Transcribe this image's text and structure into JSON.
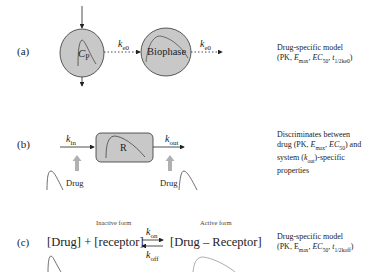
{
  "panels": {
    "a": {
      "tag": "(a)",
      "compartment_label": "C",
      "compartment_sub": "P",
      "rate1": "k",
      "rate1_sub": "e0",
      "biophase_label": "Biophase",
      "rate2": "k",
      "rate2_sub": "e0",
      "desc_line1": "Drug-specific model",
      "desc_line2_pre": "(PK, ",
      "desc_emax": "E",
      "desc_emax_sub": "max",
      "desc_ec": "EC",
      "desc_ec_sub": "50",
      "desc_t": "t",
      "desc_t_sub": "1/2ke0",
      "desc_close": ")"
    },
    "b": {
      "tag": "(b)",
      "kin": "k",
      "kin_sub": "in",
      "box_label": "R",
      "kout": "k",
      "kout_sub": "out",
      "drug_left": "Drug",
      "drug_right": "Drug",
      "desc_line1": "Discriminates between",
      "desc_line2_pre": "drug (PK, ",
      "desc_emax": "E",
      "desc_emax_sub": "max",
      "desc_ec": "EC",
      "desc_ec_sub": "50",
      "desc_line2_post": ") and",
      "desc_line3_pre": "system (",
      "desc_k": "k",
      "desc_k_sub": "out",
      "desc_line3_post": ")-specific",
      "desc_line4": "properties"
    },
    "c": {
      "tag": "(c)",
      "inactive_label": "Inactive form",
      "active_label": "Active form",
      "left_species": "[Drug] + [receptor]",
      "kon": "k",
      "kon_sub": "on",
      "koff": "k",
      "koff_sub": "off",
      "right_species": "[Drug – Receptor]",
      "desc_line1": "Drug-specific model",
      "desc_line2_pre": "(PK, E",
      "desc_emax_sub": "max",
      "desc_ec": "EC",
      "desc_ec_sub": "50",
      "desc_t": "t",
      "desc_t_sub": "1/2koff",
      "desc_close": ")"
    }
  },
  "colors": {
    "fill": "#c8c8c8",
    "stroke": "#333333",
    "arrow_gray": "#b0b0b0",
    "curve": "#555555"
  }
}
